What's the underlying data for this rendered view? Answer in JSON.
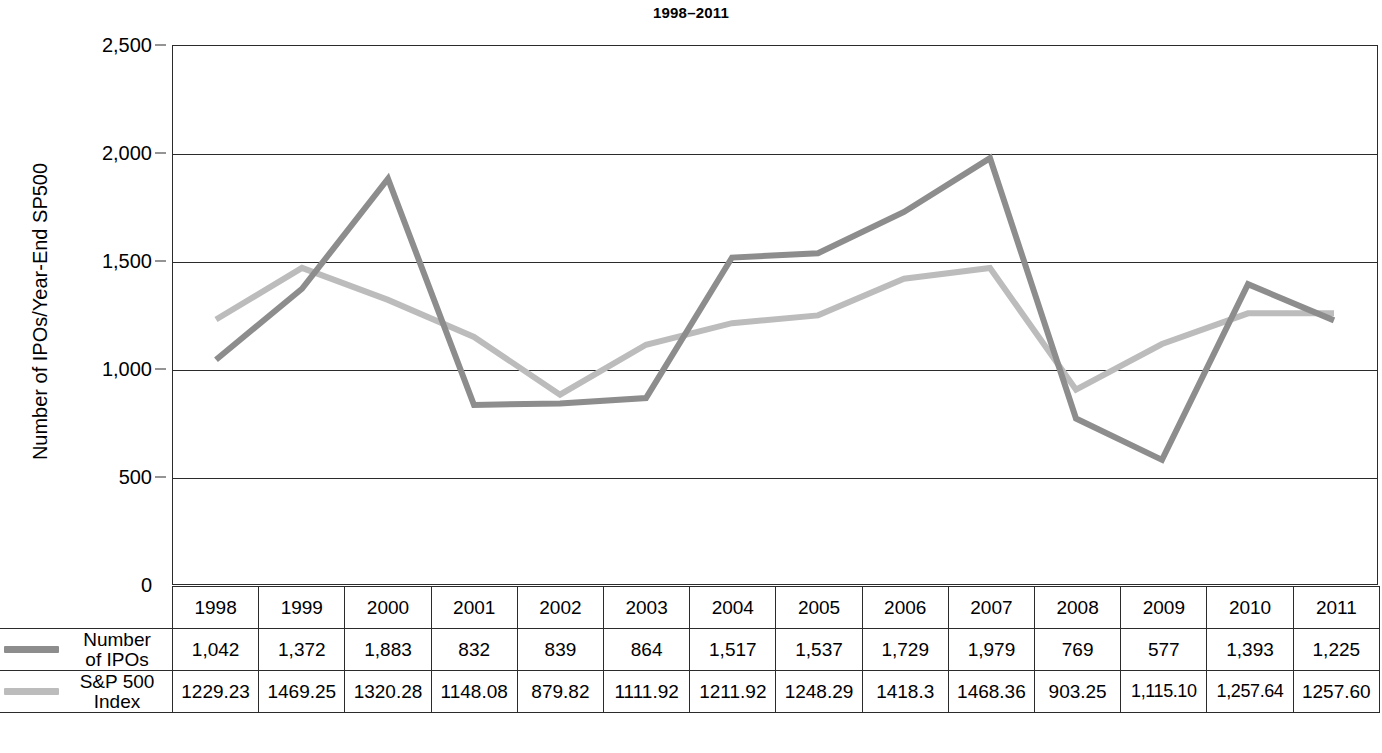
{
  "title": "1998–2011",
  "y_axis": {
    "label": "Number of IPOs/Year-End SP500",
    "ticks": [
      "0",
      "500",
      "1,000",
      "1,500",
      "2,000",
      "2,500"
    ]
  },
  "legend": {
    "ipos": {
      "label_line1": "Number",
      "label_line2": "of IPOs",
      "color": "#8d8d8d"
    },
    "sp500": {
      "label_line1": "S&P 500",
      "label_line2": "Index",
      "color": "#bcbcbc"
    }
  },
  "table": {
    "years": [
      "1998",
      "1999",
      "2000",
      "2001",
      "2002",
      "2003",
      "2004",
      "2005",
      "2006",
      "2007",
      "2008",
      "2009",
      "2010",
      "2011"
    ],
    "ipos_display": [
      "1,042",
      "1,372",
      "1,883",
      "832",
      "839",
      "864",
      "1,517",
      "1,537",
      "1,729",
      "1,979",
      "769",
      "577",
      "1,393",
      "1,225"
    ],
    "sp500_display": [
      "1229.23",
      "1469.25",
      "1320.28",
      "1148.08",
      "879.82",
      "1111.92",
      "1211.92",
      "1248.29",
      "1418.3",
      "1468.36",
      "903.25",
      "1,115.10",
      "1,257.64",
      "1257.60"
    ]
  },
  "chart_data": {
    "type": "line",
    "title": "1998–2011",
    "xlabel": "",
    "ylabel": "Number of IPOs/Year-End SP500",
    "categories": [
      1998,
      1999,
      2000,
      2001,
      2002,
      2003,
      2004,
      2005,
      2006,
      2007,
      2008,
      2009,
      2010,
      2011
    ],
    "ylim": [
      0,
      2500
    ],
    "yticks": [
      0,
      500,
      1000,
      1500,
      2000,
      2500
    ],
    "grid": "horizontal",
    "legend_position": "table-row-labels",
    "series": [
      {
        "name": "Number of IPOs",
        "color": "#8d8d8d",
        "values": [
          1042,
          1372,
          1883,
          832,
          839,
          864,
          1517,
          1537,
          1729,
          1979,
          769,
          577,
          1393,
          1225
        ]
      },
      {
        "name": "S&P 500 Index",
        "color": "#bcbcbc",
        "values": [
          1229.23,
          1469.25,
          1320.28,
          1148.08,
          879.82,
          1111.92,
          1211.92,
          1248.29,
          1418.3,
          1468.36,
          903.25,
          1115.1,
          1257.64,
          1257.6
        ]
      }
    ]
  }
}
